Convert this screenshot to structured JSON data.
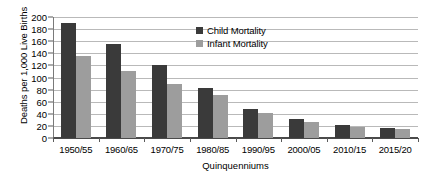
{
  "chart_data": {
    "type": "bar",
    "title": "",
    "xlabel": "Quinquenniums",
    "ylabel": "Deaths per 1,000 Live Births",
    "categories": [
      "1950/55",
      "1960/65",
      "1970/75",
      "1980/85",
      "1990/95",
      "2000/05",
      "2010/15",
      "2015/20"
    ],
    "series": [
      {
        "name": "Child Mortality",
        "color": "#3a3a3a",
        "values": [
          190,
          155,
          121,
          83,
          48,
          32,
          21,
          17
        ]
      },
      {
        "name": "Infant Mortality",
        "color": "#9d9d9d",
        "values": [
          135,
          110,
          90,
          71,
          41,
          26,
          18,
          15
        ]
      }
    ],
    "ylim": [
      0,
      200
    ],
    "ytick_step": 20,
    "yticks": [
      200,
      180,
      160,
      140,
      120,
      100,
      80,
      60,
      40,
      20,
      0
    ],
    "grid": true,
    "legend_position": "inside-top-center"
  },
  "legend": {
    "items": [
      {
        "label": "Child Mortality"
      },
      {
        "label": "Infant Mortality"
      }
    ]
  },
  "axes": {
    "y_title": "Deaths per 1,000 Live Births",
    "x_title": "Quinquenniums"
  }
}
